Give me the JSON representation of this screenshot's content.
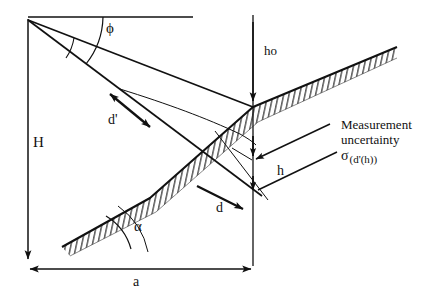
{
  "figure": {
    "type": "technical-line-diagram",
    "background_color": "#ffffff",
    "line_color": "#111111",
    "width": 432,
    "height": 300
  },
  "labels": {
    "height_H": "H",
    "angle_phi": "ϕ",
    "distance_d_prime": "d'",
    "height_ho": "ho",
    "height_h": "h",
    "distance_d": "d",
    "angle_alpha": "α",
    "baseline_a": "a"
  },
  "annotation": {
    "line1": "Measurement",
    "line2": "uncertainty",
    "sigma_symbol": "σ",
    "sigma_subscript": "(d'(h))"
  },
  "geometry": {
    "apex": {
      "x": 28,
      "y": 19
    },
    "baseline_y": 269,
    "vertical_axis_x": 253,
    "intersection_top": {
      "x": 253,
      "y": 107
    },
    "intersection_mid": {
      "x": 253,
      "y": 160
    },
    "intersection_low": {
      "x": 253,
      "y": 192
    },
    "slope_start": {
      "x": 62,
      "y": 247
    },
    "slope_end": {
      "x": 397,
      "y": 47
    }
  }
}
